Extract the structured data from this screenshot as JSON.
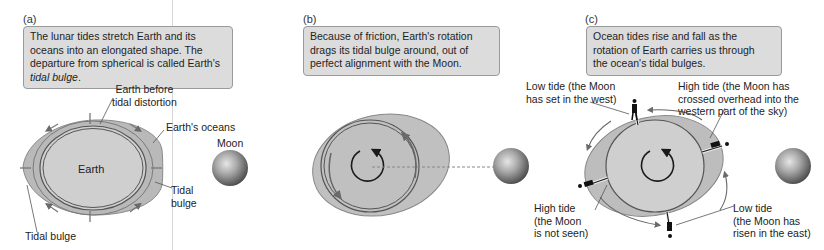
{
  "panels": [
    {
      "id": "a",
      "label": "(a)",
      "caption_parts": [
        "The lunar tides stretch Earth and its oceans into an elongated shape. The departure from spherical is called Earth's ",
        "tidal bulge",
        "."
      ],
      "labels": {
        "earth_before": [
          "Earth before",
          "tidal distortion"
        ],
        "oceans": "Earth's oceans",
        "moon": "Moon",
        "earth": "Earth",
        "tidal_bulge_right": [
          "Tidal",
          "bulge"
        ],
        "tidal_bulge_left": "Tidal bulge"
      }
    },
    {
      "id": "b",
      "label": "(b)",
      "caption_lines": [
        "Because of friction, Earth's rotation",
        "drags its tidal bulge around, out of",
        "perfect alignment with the Moon."
      ]
    },
    {
      "id": "c",
      "label": "(c)",
      "caption_lines": [
        "Ocean tides rise and fall as the",
        "rotation of Earth carries us through",
        "the ocean's tidal bulges."
      ],
      "labels": {
        "low_tide_west": [
          "Low tide (the Moon",
          "has set in the west)"
        ],
        "high_tide_overhead": [
          "High tide (the Moon has",
          "crossed overhead into the",
          "western part of the sky)"
        ],
        "high_tide_unseen": [
          "High tide",
          "(the Moon",
          "is not seen)"
        ],
        "low_tide_east": [
          "Low tide",
          "(the Moon has",
          "risen in the east)"
        ]
      }
    }
  ],
  "colors": {
    "ocean_fill": "#b9b9b9",
    "earth_fill": "#cfcfcf",
    "outline": "#6e6e6e",
    "caption_bg": "#dcdcdc",
    "caption_border": "#9a9a9a",
    "arrow": "#5a5a5a",
    "dark": "#1a1a1a"
  }
}
